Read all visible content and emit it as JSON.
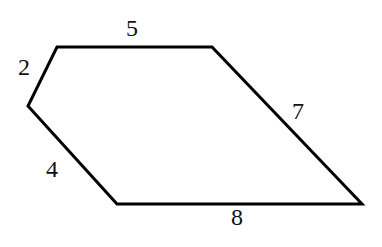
{
  "diagram": {
    "type": "pentagon",
    "stroke_color": "#000000",
    "vertices": [
      {
        "x": 57,
        "y": 47
      },
      {
        "x": 212,
        "y": 47
      },
      {
        "x": 362,
        "y": 204
      },
      {
        "x": 117,
        "y": 204
      },
      {
        "x": 28,
        "y": 106
      }
    ],
    "side_labels": {
      "top": "5",
      "upper_left": "2",
      "right": "7",
      "bottom": "8",
      "lower_left": "4"
    }
  }
}
